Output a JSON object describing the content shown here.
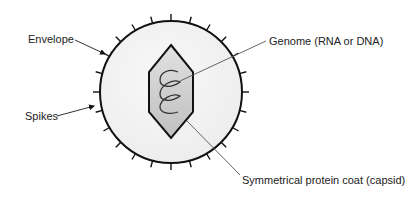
{
  "diagram": {
    "labels": {
      "envelope": "Envelope",
      "spikes": "Spikes",
      "genome": "Genome (RNA or DNA)",
      "capsid": "Symmetrical protein coat (capsid)"
    },
    "colors": {
      "envelope_fill": "#f3f3f3",
      "outline": "#111111",
      "capsid_fill_light": "#ececec",
      "capsid_fill_dark": "#c4c4c4",
      "leader_line": "#555555",
      "text": "#222222"
    },
    "geometry": {
      "center": [
        171,
        92
      ],
      "radius": 71,
      "spike_count": 24,
      "spike_length": 7
    }
  }
}
